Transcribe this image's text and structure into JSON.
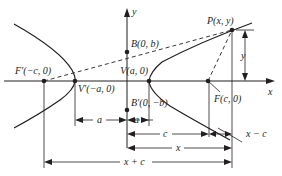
{
  "diagram": {
    "axes": {
      "x_label": "x",
      "y_label": "y"
    },
    "points": {
      "F_prime": "F′(−c, 0)",
      "V_prime": "V′(−a, 0)",
      "V": "V(a, 0)",
      "F": "F(c, 0)",
      "B": "B(0, b)",
      "B_prime": "B′(0, −b)",
      "P": "P(x, y)"
    },
    "dimensions": {
      "y": "y",
      "a_left": "a",
      "a_right": "a",
      "c": "c",
      "x_minus_c": "x − c",
      "x": "x",
      "x_plus_c": "x + c"
    },
    "colors": {
      "ink": "#231f20",
      "background": "#ffffff"
    }
  }
}
